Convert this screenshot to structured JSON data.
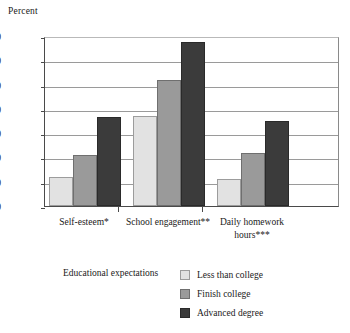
{
  "chart_data": {
    "type": "bar",
    "title": "",
    "ylabel": "Percent",
    "xlabel": "",
    "ylim": [
      0,
      70
    ],
    "yticks": [
      0,
      10,
      20,
      30,
      40,
      50,
      60,
      70
    ],
    "grid": true,
    "categories": [
      "Self-esteem*",
      "School engagement**",
      "Daily homework hours***"
    ],
    "series": [
      {
        "name": "Less than college",
        "color": "#e2e2e2",
        "values": [
          12,
          37,
          11
        ]
      },
      {
        "name": "Finish college",
        "color": "#9a9a9a",
        "values": [
          21,
          52,
          22
        ]
      },
      {
        "name": "Advanced degree",
        "color": "#3b3b3b",
        "values": [
          36.5,
          67.5,
          35
        ]
      }
    ],
    "legend": {
      "title": "Educational expectations",
      "position": "bottom",
      "entries": [
        "Less than college",
        "Finish college",
        "Advanced degree"
      ]
    }
  }
}
